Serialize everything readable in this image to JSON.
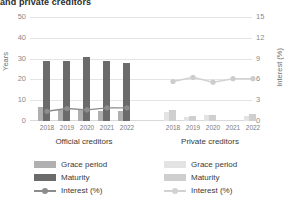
{
  "title": "and private creditors",
  "axes": {
    "left_label": "Years",
    "right_label": "Interest (%)",
    "left_ticks": [
      "0",
      "10",
      "20",
      "30",
      "40",
      "50"
    ],
    "right_ticks": [
      "0",
      "3",
      "6",
      "9",
      "12",
      "15"
    ]
  },
  "panels": [
    {
      "id": "official",
      "caption": "Official creditors"
    },
    {
      "id": "private",
      "caption": "Private creditors"
    }
  ],
  "legend_left": [
    {
      "label": "Grace period",
      "color": "#b0b0b0",
      "type": "bar"
    },
    {
      "label": "Maturity",
      "color": "#6b6b6b",
      "type": "bar"
    },
    {
      "label": "Interest (%)",
      "color": "#8c8c8c",
      "type": "line"
    }
  ],
  "legend_right": [
    {
      "label": "Grace period",
      "color": "#e3e3e3",
      "type": "bar"
    },
    {
      "label": "Maturity",
      "color": "#cfcfcf",
      "type": "bar"
    },
    {
      "label": "Interest (%)",
      "color": "#d2d2d2",
      "type": "line"
    }
  ],
  "chart_data": {
    "type": "bar",
    "title": "and private creditors",
    "xlabel": "",
    "ylabel": "Years",
    "ylabel_secondary": "Interest (%)",
    "ylim": [
      0,
      50
    ],
    "ylim_secondary": [
      0,
      15
    ],
    "grid": true,
    "legend_position": "bottom",
    "categories": [
      "2018",
      "2019",
      "2020",
      "2021",
      "2022"
    ],
    "panels": [
      {
        "name": "Official creditors",
        "series": [
          {
            "name": "Grace period",
            "axis": "left",
            "values": [
              6.5,
              5.5,
              5.5,
              5.0,
              5.0
            ]
          },
          {
            "name": "Maturity",
            "axis": "left",
            "values": [
              29,
              29,
              31,
              29,
              28
            ]
          },
          {
            "name": "Interest (%)",
            "axis": "right",
            "values": [
              1.4,
              1.8,
              1.6,
              1.9,
              1.9
            ]
          }
        ]
      },
      {
        "name": "Private creditors",
        "series": [
          {
            "name": "Grace period",
            "axis": "left",
            "values": [
              4.5,
              2.0,
              3.0,
              0.0,
              2.5
            ]
          },
          {
            "name": "Maturity",
            "axis": "left",
            "values": [
              5.5,
              2.5,
              3.0,
              0.0,
              3.5
            ]
          },
          {
            "name": "Interest (%)",
            "axis": "right",
            "values": [
              5.7,
              6.3,
              5.6,
              6.1,
              6.1
            ]
          }
        ]
      }
    ]
  }
}
